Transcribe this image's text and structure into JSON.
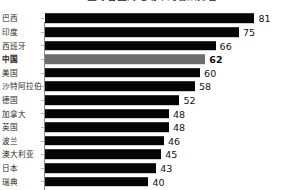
{
  "chart_data": {
    "type": "bar",
    "orientation": "horizontal",
    "title": "全球各国对电动车的看法排名",
    "xlabel": "",
    "ylabel": "",
    "xlim": [
      0,
      90
    ],
    "grid": false,
    "legend": null,
    "value_labels": true,
    "categories": [
      "巴西",
      "印度",
      "西班牙",
      "中国",
      "美国",
      "沙特阿拉伯",
      "德国",
      "加拿大",
      "英国",
      "波兰",
      "澳大利亚",
      "日本",
      "瑞典"
    ],
    "values": [
      81,
      75,
      66,
      62,
      60,
      58,
      52,
      48,
      48,
      46,
      45,
      43,
      40
    ],
    "highlight_category": "中国",
    "colors": {
      "bar": "#050505",
      "highlight_bar": "#6e6e6e",
      "text": "#1f1f1f",
      "axis": "#8a8a8a",
      "background": "#ffffff"
    }
  },
  "rows": [
    {
      "label": "巴西",
      "value": "81",
      "bold": false,
      "highlight": false
    },
    {
      "label": "印度",
      "value": "75",
      "bold": false,
      "highlight": false
    },
    {
      "label": "西班牙",
      "value": "66",
      "bold": false,
      "highlight": false
    },
    {
      "label": "中国",
      "value": "62",
      "bold": true,
      "highlight": true
    },
    {
      "label": "美国",
      "value": "60",
      "bold": false,
      "highlight": false
    },
    {
      "label": "沙特阿拉伯",
      "value": "58",
      "bold": false,
      "highlight": false
    },
    {
      "label": "德国",
      "value": "52",
      "bold": false,
      "highlight": false
    },
    {
      "label": "加拿大",
      "value": "48",
      "bold": false,
      "highlight": false
    },
    {
      "label": "英国",
      "value": "48",
      "bold": false,
      "highlight": false
    },
    {
      "label": "波兰",
      "value": "46",
      "bold": false,
      "highlight": false
    },
    {
      "label": "澳大利亚",
      "value": "45",
      "bold": false,
      "highlight": false
    },
    {
      "label": "日本",
      "value": "43",
      "bold": false,
      "highlight": false
    },
    {
      "label": "瑞典",
      "value": "40",
      "bold": false,
      "highlight": false
    }
  ]
}
